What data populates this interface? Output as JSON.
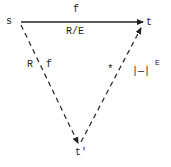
{
  "diagram": {
    "type": "commutative-triangle",
    "nodes": [
      {
        "id": "s",
        "label": "s"
      },
      {
        "id": "t",
        "label": "t"
      },
      {
        "id": "t_prime",
        "label": "t'"
      }
    ],
    "edges": [
      {
        "from": "s",
        "to": "t",
        "style": "solid",
        "label_above": "f",
        "label_below": "R/E"
      },
      {
        "from": "s",
        "to": "t_prime",
        "style": "dashed",
        "label_left": "R",
        "label_right": "f"
      },
      {
        "from": "t_prime",
        "to": "t",
        "style": "dashed",
        "label": "|—|",
        "label_sup": "E"
      }
    ],
    "marker": "*"
  }
}
